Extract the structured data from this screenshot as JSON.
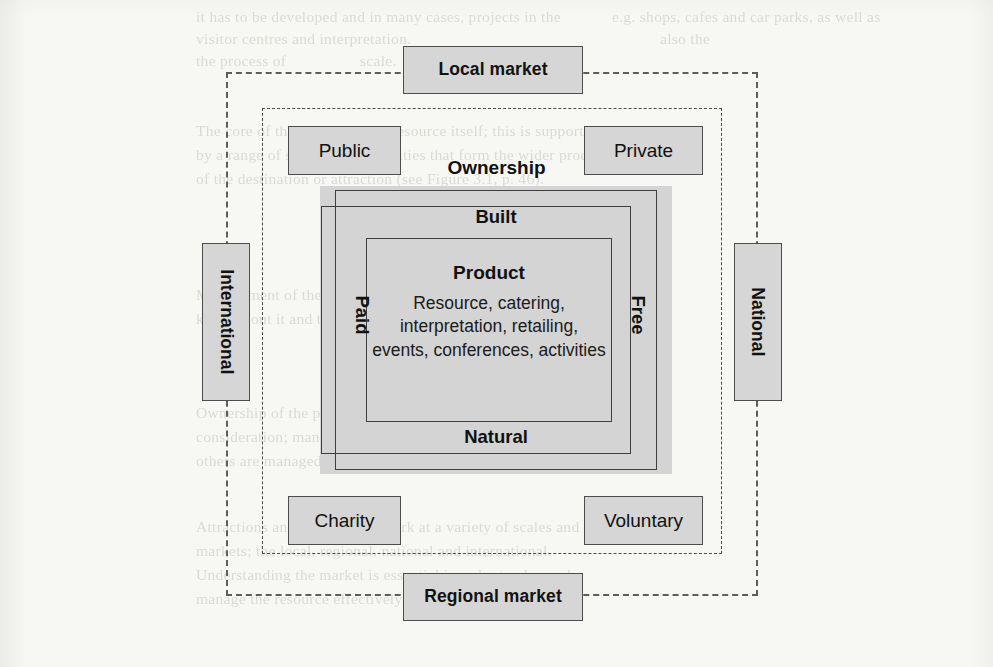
{
  "diagram": {
    "market_level": {
      "top_label": "Local market",
      "bottom_label": "Regional market",
      "left_label": "International",
      "right_label": "National"
    },
    "ownership_level": {
      "heading": "Ownership",
      "top_left_label": "Public",
      "top_right_label": "Private",
      "bottom_left_label": "Charity",
      "bottom_right_label": "Voluntary"
    },
    "core": {
      "environment": {
        "top_label": "Built",
        "bottom_label": "Natural"
      },
      "charging": {
        "left_label": "Paid",
        "right_label": "Free"
      },
      "product": {
        "heading": "Product",
        "items": "Resource, catering, interpretation, retailing, events, conferences, activities"
      }
    },
    "colors": {
      "page_background": "#f7f7f4",
      "chip_fill": "#d6d6d6",
      "chip_border": "#4d4d4d",
      "core_fill": "#d4d4d4",
      "rect_stroke": "#3f3f3f",
      "dashed_stroke": "#5d5d5d",
      "text": "#111111"
    }
  },
  "page_bleed_through": {
    "lines": [
      {
        "text": "it has to be developed and in many cases, projects in the",
        "x": 196,
        "y": 8
      },
      {
        "text": "e.g. shops, cafes and car parks, as well as",
        "x": 612,
        "y": 8
      },
      {
        "text": "visitor centres and interpretation.",
        "x": 196,
        "y": 30
      },
      {
        "text": "also the",
        "x": 660,
        "y": 30
      },
      {
        "text": "the process of",
        "x": 196,
        "y": 52
      },
      {
        "text": "scale.",
        "x": 360,
        "y": 52
      },
      {
        "text": "The core of the product is the resource itself; this is supported",
        "x": 196,
        "y": 122
      },
      {
        "text": "by a range of services and facilities that form the wider product",
        "x": 196,
        "y": 146
      },
      {
        "text": "of the destination or attraction (see Figure 3.1, p. 46).",
        "x": 196,
        "y": 170
      },
      {
        "text": "Management of the product is important to ensure that people",
        "x": 196,
        "y": 286
      },
      {
        "text": "know about it and that expectations and experiences can",
        "x": 196,
        "y": 310
      },
      {
        "text": "Ownership of the product and its components is a key",
        "x": 196,
        "y": 404
      },
      {
        "text": "consideration; many are in the public or private sector but",
        "x": 196,
        "y": 428
      },
      {
        "text": "others are managed by charities or trust bodies.",
        "x": 196,
        "y": 452
      },
      {
        "text": "Attractions and destinations work at a variety of scales and",
        "x": 196,
        "y": 518
      },
      {
        "text": "markets; the local, regional, national and international.",
        "x": 196,
        "y": 542
      },
      {
        "text": "Understanding the market is essential in order to plan and",
        "x": 196,
        "y": 566
      },
      {
        "text": "manage the resource effectively.",
        "x": 196,
        "y": 590
      }
    ]
  }
}
